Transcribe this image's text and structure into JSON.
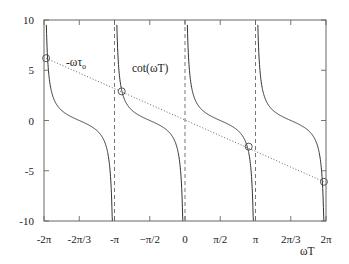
{
  "chart_data": {
    "type": "line",
    "title": "",
    "xlabel": "ωT",
    "ylabel": "",
    "xlim": [
      -6.2832,
      6.2832
    ],
    "ylim": [
      -10,
      10
    ],
    "grid": false,
    "x_ticks": [
      {
        "value": -6.2832,
        "label": "-2π"
      },
      {
        "value": -4.7124,
        "label": "-2π/3"
      },
      {
        "value": -3.1416,
        "label": "-π"
      },
      {
        "value": -1.5708,
        "label": "−π/2"
      },
      {
        "value": 0,
        "label": "0"
      },
      {
        "value": 1.5708,
        "label": "π/2"
      },
      {
        "value": 3.1416,
        "label": "π"
      },
      {
        "value": 4.7124,
        "label": "2π/3"
      },
      {
        "value": 6.2832,
        "label": "2π"
      }
    ],
    "y_ticks": [
      {
        "value": 10,
        "label": "10"
      },
      {
        "value": 5,
        "label": "5"
      },
      {
        "value": 0,
        "label": "0"
      },
      {
        "value": -5,
        "label": "-5"
      },
      {
        "value": -10,
        "label": "-10"
      }
    ],
    "series": [
      {
        "name": "cot(ωT)",
        "style": "solid",
        "function": "cot",
        "branches": [
          [
            -6.2832,
            -3.1416
          ],
          [
            -3.1416,
            0
          ],
          [
            0,
            3.1416
          ],
          [
            3.1416,
            6.2832
          ]
        ]
      },
      {
        "name": "-ωτ0",
        "style": "dotted",
        "function": "linear",
        "x": [
          -6.2832,
          6.2832
        ],
        "y": [
          6.2,
          -6.1
        ]
      }
    ],
    "asymptotes": [
      -3.1416,
      0,
      3.1416
    ],
    "intersections": [
      {
        "x": -6.19,
        "y": 6.2
      },
      {
        "x": -2.82,
        "y": 2.9
      },
      {
        "x": 2.84,
        "y": -2.6
      },
      {
        "x": 6.19,
        "y": -6.1
      }
    ],
    "annotations": [
      {
        "text": "cot(ωT)",
        "x": -2.6,
        "y": 7.1
      },
      {
        "text": "-ωτ",
        "subscript": "o",
        "x": -5.2,
        "y": 4.3
      }
    ],
    "legend": "none"
  },
  "labels": {
    "curve": "cot(ωT)",
    "line_main": "-ωτ",
    "line_sub": "o",
    "xaxis": "ωT"
  }
}
